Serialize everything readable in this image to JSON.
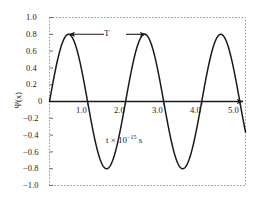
{
  "chart_data": {
    "type": "line",
    "title": "",
    "subtitle": "",
    "xlabel": "t × 10⁻¹⁵ s",
    "ylabel": "Ψ(x)",
    "xlim": [
      0,
      5.15
    ],
    "ylim": [
      -1.0,
      1.0
    ],
    "grid": false,
    "legend": null,
    "x_ticks": [
      1.0,
      2.0,
      3.0,
      4.0,
      5.0
    ],
    "x_tick_labels": [
      "1.0",
      "2.0",
      "3.0",
      "4.0",
      "5.0"
    ],
    "y_ticks": [
      1.0,
      0.8,
      0.6,
      0.4,
      0.2,
      0,
      -0.2,
      -0.4,
      -0.6,
      -0.8,
      -1.0
    ],
    "y_tick_labels": [
      "1.0",
      "0.8",
      "0.6",
      "0.4",
      "0.2",
      "0",
      "−0.2",
      "−0.4",
      "−0.6",
      "−0.8",
      "−1.0"
    ],
    "series": [
      {
        "name": "wavefunction",
        "kind": "sine",
        "amplitude": 0.8,
        "period": 2.0,
        "phase": 0,
        "color": "#1a1a1a",
        "peaks_x": [
          0.5,
          2.5,
          4.5
        ],
        "peaks_y": [
          0.8,
          0.8,
          0.8
        ],
        "troughs_x": [
          1.5,
          3.5
        ],
        "troughs_y": [
          -0.8,
          -0.8
        ],
        "zero_crossings_x": [
          0,
          1.0,
          2.0,
          3.0,
          4.0,
          5.0
        ]
      }
    ],
    "annotations": [
      {
        "name": "period-marker",
        "label": "T",
        "x_start": 0.5,
        "x_end": 2.5,
        "y": 0.8,
        "style": "double-arrow"
      },
      {
        "name": "x-axis-units",
        "label": "t × 10⁻¹⁵ s",
        "x": 2.35,
        "y": -0.42
      }
    ],
    "axis_styles": {
      "frame_color": "#9a9a9a",
      "frame_style": "dotted",
      "zero_axis_color": "#1a1a1a",
      "zero_axis_arrow": true,
      "background": "#ffffff"
    }
  },
  "labels": {
    "y_axis_title": "Ψ(x)",
    "period_symbol": "T",
    "x_units_prefix": "t × 10",
    "x_units_exponent": "−15",
    "x_units_suffix": " s"
  }
}
